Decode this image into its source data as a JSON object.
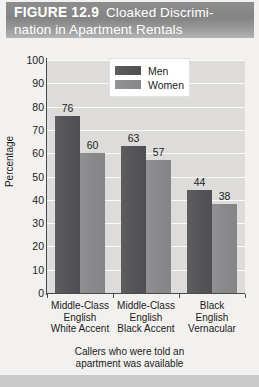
{
  "figure": {
    "number_label": "FIGURE 12.9",
    "title_line1": "Cloaked Discrimi-",
    "title_line2": "nation in Apartment Rentals"
  },
  "caption": {
    "line1": "Callers who were told an",
    "line2": "apartment was available"
  },
  "colors": {
    "men_bar": "#56565a",
    "women_bar": "#8a8a8c",
    "plot_background": "#dddcda",
    "gridline": "#fbfbfa",
    "header_band": "#8d8d8d",
    "panel_background": "#f2f1ef"
  },
  "chart_data": {
    "type": "bar",
    "xlabel": "",
    "ylabel": "Percentage",
    "ylim": [
      0,
      100
    ],
    "yticks": [
      0,
      10,
      20,
      30,
      40,
      50,
      60,
      70,
      80,
      90,
      100
    ],
    "grid": true,
    "legend_position": "top-center",
    "categories": [
      "Middle-Class English White Accent",
      "Middle-Class English Black Accent",
      "Black English Vernacular"
    ],
    "category_lines": [
      [
        "Middle-Class",
        "English",
        "White Accent"
      ],
      [
        "Middle-Class",
        "English",
        "Black Accent"
      ],
      [
        "Black",
        "English",
        "Vernacular"
      ]
    ],
    "series": [
      {
        "name": "Men",
        "values": [
          76,
          63,
          44
        ]
      },
      {
        "name": "Women",
        "values": [
          60,
          57,
          38
        ]
      }
    ]
  }
}
